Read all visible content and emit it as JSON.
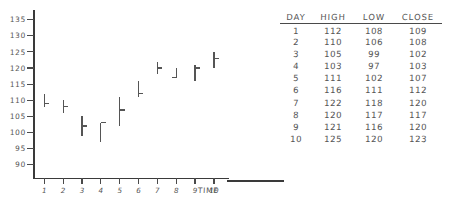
{
  "chart_data": {
    "type": "ohlc",
    "title": "",
    "xlabel": "TIME",
    "ylabel": "",
    "x": [
      1,
      2,
      3,
      4,
      5,
      6,
      7,
      8,
      9,
      10
    ],
    "ylim": [
      86,
      138
    ],
    "xlim": [
      0.4,
      10.8
    ],
    "grid": false,
    "legend": "none",
    "y_ticks": [
      135,
      130,
      125,
      120,
      115,
      110,
      105,
      100,
      95,
      90
    ],
    "x_tick_labels": [
      "1",
      "2",
      "3",
      "4",
      "5",
      "6",
      "7",
      "8",
      "9",
      "10"
    ],
    "series": [
      {
        "name": "HIGH",
        "values": [
          112,
          110,
          105,
          103,
          111,
          116,
          122,
          120,
          121,
          125
        ]
      },
      {
        "name": "LOW",
        "values": [
          108,
          106,
          99,
          97,
          102,
          111,
          118,
          117,
          116,
          120
        ]
      },
      {
        "name": "CLOSE",
        "values": [
          109,
          108,
          102,
          103,
          107,
          112,
          120,
          117,
          120,
          123
        ]
      }
    ]
  },
  "table": {
    "headers": [
      "DAY",
      "HIGH",
      "LOW",
      "CLOSE"
    ],
    "rows": [
      {
        "day": "1",
        "high": "112",
        "low": "108",
        "close": "109"
      },
      {
        "day": "2",
        "high": "110",
        "low": "106",
        "close": "108"
      },
      {
        "day": "3",
        "high": "105",
        "low": "99",
        "close": "102"
      },
      {
        "day": "4",
        "high": "103",
        "low": "97",
        "close": "103"
      },
      {
        "day": "5",
        "high": "111",
        "low": "102",
        "close": "107"
      },
      {
        "day": "6",
        "high": "116",
        "low": "111",
        "close": "112"
      },
      {
        "day": "7",
        "high": "122",
        "low": "118",
        "close": "120"
      },
      {
        "day": "8",
        "high": "120",
        "low": "117",
        "close": "117"
      },
      {
        "day": "9",
        "high": "121",
        "low": "116",
        "close": "120"
      },
      {
        "day": "10",
        "high": "125",
        "low": "120",
        "close": "123"
      }
    ]
  },
  "colors": {
    "ink": "#4a4a4a",
    "axis": "#3a3a3a",
    "background": "#ffffff"
  }
}
